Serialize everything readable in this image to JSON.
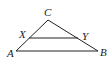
{
  "figure": {
    "points": {
      "A": {
        "label": "A",
        "x": 16,
        "y": 51
      },
      "B": {
        "label": "B",
        "x": 98,
        "y": 51
      },
      "C": {
        "label": "C",
        "x": 48,
        "y": 20
      },
      "X": {
        "label": "X",
        "x": 29,
        "y": 38
      },
      "Y": {
        "label": "Y",
        "x": 78,
        "y": 38
      }
    },
    "segments": [
      {
        "from": "A",
        "to": "C"
      },
      {
        "from": "C",
        "to": "B"
      },
      {
        "from": "A",
        "to": "B"
      },
      {
        "from": "X",
        "to": "Y"
      }
    ],
    "labels": {
      "A": "A",
      "B": "B",
      "C": "C",
      "X": "X",
      "Y": "Y"
    },
    "colors": {
      "line": "#222222",
      "text": "#1a1a1a",
      "background": "#ffffff"
    }
  }
}
